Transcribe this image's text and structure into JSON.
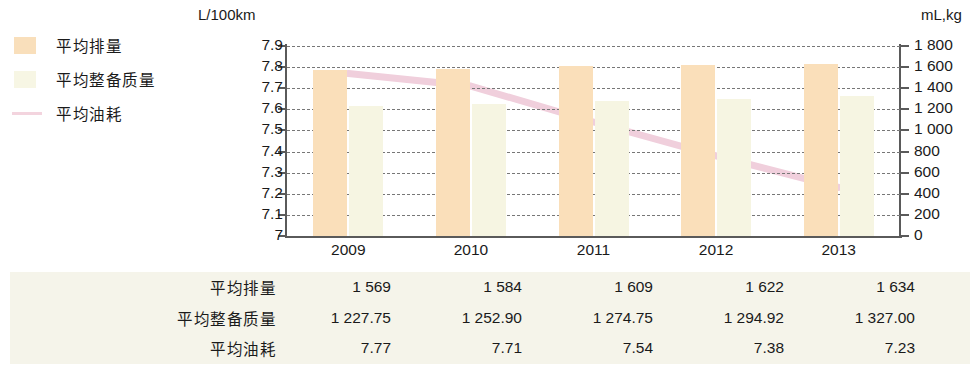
{
  "legend": {
    "items": [
      {
        "label": "平均排量",
        "swatch": "bar-swatch-orange",
        "color": "#f9dfbb"
      },
      {
        "label": "平均整备质量",
        "swatch": "bar-swatch-cream",
        "color": "#f7f6e4"
      },
      {
        "label": "平均油耗",
        "swatch": "line-swatch-pink",
        "color": "#f3d4de"
      }
    ]
  },
  "axes": {
    "left_unit": "L/100km",
    "right_unit": "mL,kg",
    "left_ticks": [
      "7.9",
      "7.8",
      "7.7",
      "7.6",
      "7.5",
      "7.4",
      "7.3",
      "7.2",
      "7.1",
      "7"
    ],
    "right_ticks": [
      "1 800",
      "1 600",
      "1 400",
      "1 200",
      "1 000",
      "800",
      "600",
      "400",
      "200",
      "0"
    ]
  },
  "chart_data": {
    "type": "bar",
    "title": "",
    "xlabel": "",
    "ylabel": "L/100km",
    "y2label": "mL,kg",
    "categories": [
      "2009",
      "2010",
      "2011",
      "2012",
      "2013"
    ],
    "ylim": [
      7,
      7.9
    ],
    "y2lim": [
      0,
      1800
    ],
    "grid": true,
    "legend_position": "top-left",
    "series": [
      {
        "name": "平均排量",
        "type": "bar",
        "axis": "right",
        "unit": "mL",
        "color": "#fadfba",
        "values": [
          1569,
          1584,
          1609,
          1622,
          1634
        ]
      },
      {
        "name": "平均整备质量",
        "type": "bar",
        "axis": "right",
        "unit": "kg",
        "color": "#f6f5e2",
        "values": [
          1227.75,
          1252.9,
          1274.75,
          1294.92,
          1327.0
        ]
      },
      {
        "name": "平均油耗",
        "type": "line",
        "axis": "left",
        "unit": "L/100km",
        "color": "#f0cfdc",
        "values": [
          7.77,
          7.71,
          7.54,
          7.38,
          7.23
        ]
      }
    ]
  },
  "table": {
    "rows": [
      {
        "label": "平均排量",
        "cells": [
          "1 569",
          "1 584",
          "1 609",
          "1 622",
          "1 634"
        ]
      },
      {
        "label": "平均整备质量",
        "cells": [
          "1 227.75",
          "1 252.90",
          "1 274.75",
          "1 294.92",
          "1 327.00"
        ]
      },
      {
        "label": "平均油耗",
        "cells": [
          "7.77",
          "7.71",
          "7.54",
          "7.38",
          "7.23"
        ]
      }
    ]
  }
}
